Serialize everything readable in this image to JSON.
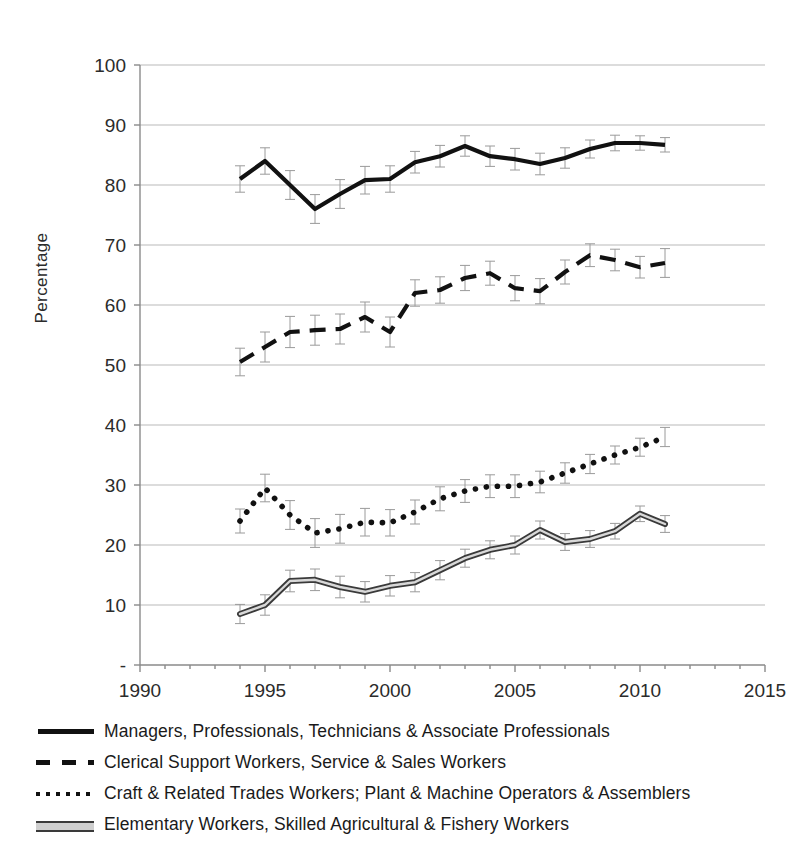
{
  "chart_data": {
    "type": "line",
    "title": "",
    "xlabel": "",
    "ylabel": "Percentage",
    "xlim": [
      1990,
      2015
    ],
    "ylim": [
      0,
      100
    ],
    "grid": true,
    "grid_axis": "y",
    "legend_position": "bottom",
    "error_bars": true,
    "x_ticks": [
      1990,
      1995,
      2000,
      2005,
      2010,
      2015
    ],
    "x_minor_tick_interval": 1,
    "y_ticks": [
      0,
      10,
      20,
      30,
      40,
      50,
      60,
      70,
      80,
      90,
      100
    ],
    "y_tick_labels": [
      "-",
      "10",
      "20",
      "30",
      "40",
      "50",
      "60",
      "70",
      "80",
      "90",
      "100"
    ],
    "x": [
      1994,
      1995,
      1996,
      1997,
      1998,
      1999,
      2000,
      2001,
      2002,
      2003,
      2004,
      2005,
      2006,
      2007,
      2008,
      2009,
      2010,
      2011
    ],
    "series": [
      {
        "name": "Managers, Professionals, Technicians & Associate Professionals",
        "style": "solid",
        "color": "#111111",
        "values": [
          81.0,
          84.0,
          80.0,
          76.0,
          78.5,
          80.8,
          81.0,
          83.8,
          84.8,
          86.5,
          84.8,
          84.3,
          83.5,
          84.5,
          86.0,
          87.0,
          87.0,
          86.7
        ],
        "errors": [
          2.2,
          2.2,
          2.4,
          2.4,
          2.4,
          2.3,
          2.2,
          1.8,
          1.8,
          1.7,
          1.7,
          1.8,
          1.8,
          1.7,
          1.5,
          1.3,
          1.2,
          1.2
        ]
      },
      {
        "name": "Clerical Support Workers, Service & Sales Workers",
        "style": "dashed",
        "color": "#111111",
        "values": [
          50.5,
          53.0,
          55.5,
          55.8,
          56.0,
          58.0,
          55.5,
          62.0,
          62.5,
          64.5,
          65.3,
          62.8,
          62.3,
          65.5,
          68.3,
          67.5,
          66.3,
          67.0
        ],
        "errors": [
          2.3,
          2.5,
          2.6,
          2.5,
          2.5,
          2.5,
          2.5,
          2.2,
          2.2,
          2.1,
          2.0,
          2.1,
          2.1,
          2.0,
          1.9,
          1.8,
          1.8,
          2.4
        ]
      },
      {
        "name": "Craft & Related Trades Workers; Plant & Machine Operators & Assemblers",
        "style": "dotted",
        "color": "#111111",
        "values": [
          24.0,
          29.5,
          25.0,
          22.0,
          22.7,
          23.8,
          23.7,
          25.5,
          27.7,
          29.0,
          29.8,
          29.8,
          30.5,
          32.0,
          33.5,
          35.0,
          36.3,
          38.0
        ],
        "errors": [
          2.0,
          2.3,
          2.4,
          2.4,
          2.4,
          2.3,
          2.2,
          2.0,
          2.0,
          1.9,
          1.9,
          1.9,
          1.8,
          1.7,
          1.6,
          1.5,
          1.5,
          1.6
        ]
      },
      {
        "name": "Elementary Workers, Skilled Agricultural & Fishery Workers",
        "style": "double",
        "color": "#3a3a3a",
        "values": [
          8.5,
          10.0,
          14.0,
          14.2,
          13.0,
          12.2,
          13.2,
          13.8,
          15.8,
          17.8,
          19.2,
          20.0,
          22.5,
          20.5,
          21.0,
          22.3,
          25.2,
          23.5
        ],
        "errors": [
          1.6,
          1.7,
          1.8,
          1.8,
          1.8,
          1.7,
          1.7,
          1.6,
          1.6,
          1.5,
          1.5,
          1.5,
          1.5,
          1.4,
          1.4,
          1.3,
          1.3,
          1.4
        ]
      }
    ]
  },
  "legend": {
    "items": [
      {
        "label": "Managers, Professionals, Technicians & Associate Professionals",
        "style": "solid"
      },
      {
        "label": "Clerical Support Workers, Service & Sales Workers",
        "style": "dashed"
      },
      {
        "label": "Craft & Related Trades Workers; Plant & Machine Operators & Assemblers",
        "style": "dotted"
      },
      {
        "label": "Elementary Workers, Skilled Agricultural & Fishery Workers",
        "style": "double"
      }
    ]
  },
  "axis": {
    "y_title": "Percentage"
  }
}
